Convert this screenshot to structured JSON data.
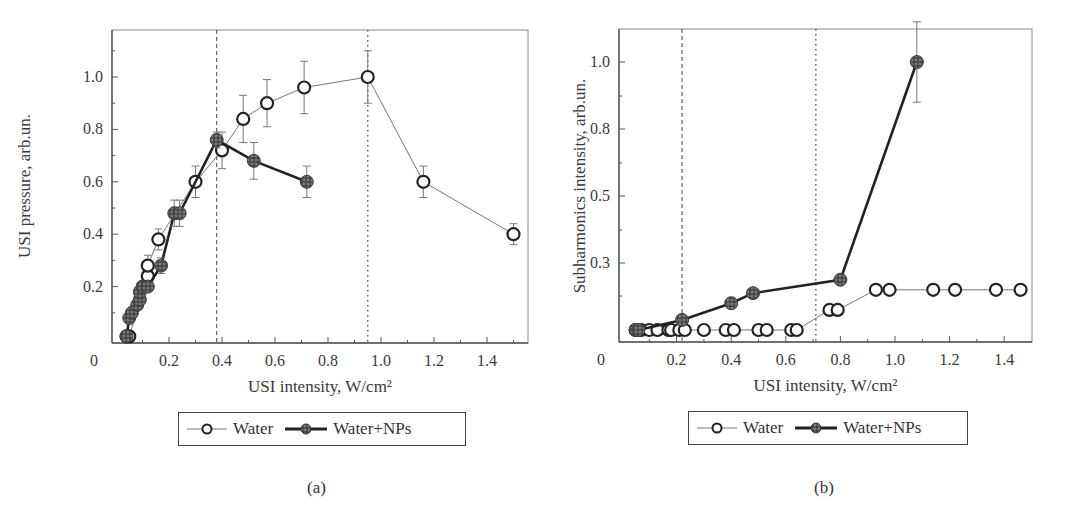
{
  "chart_data": [
    {
      "type": "line",
      "panel_label": "(a)",
      "title": "",
      "xlabel": "USI intensity, W/cm²",
      "ylabel": "USI pressure, arb.un.",
      "xlim": [
        0,
        1.55
      ],
      "ylim": [
        0,
        1.15
      ],
      "x_ticks": [
        "0",
        "0.2",
        "0.4",
        "0.6",
        "0.8",
        "1.0",
        "1.2",
        "1.4"
      ],
      "y_ticks": [
        "0.2",
        "0.4",
        "0.6",
        "0.8",
        "1.0"
      ],
      "grid": false,
      "legend_position": "below",
      "vertical_lines": [
        {
          "x": 0.38,
          "style": "dashed"
        },
        {
          "x": 0.95,
          "style": "dotted"
        }
      ],
      "series": [
        {
          "name": "Water",
          "marker": "open-circle",
          "line": "thin",
          "points": [
            {
              "x": 0.04,
              "y": 0.01
            },
            {
              "x": 0.05,
              "y": 0.01
            },
            {
              "x": 0.12,
              "y": 0.24,
              "err": 0.04
            },
            {
              "x": 0.12,
              "y": 0.28,
              "err": 0.04
            },
            {
              "x": 0.16,
              "y": 0.38,
              "err": 0.04
            },
            {
              "x": 0.3,
              "y": 0.6,
              "err": 0.06
            },
            {
              "x": 0.4,
              "y": 0.72,
              "err": 0.07
            },
            {
              "x": 0.48,
              "y": 0.84,
              "err": 0.09
            },
            {
              "x": 0.57,
              "y": 0.9,
              "err": 0.09
            },
            {
              "x": 0.71,
              "y": 0.96,
              "err": 0.1
            },
            {
              "x": 0.95,
              "y": 1.0,
              "err": 0.1
            },
            {
              "x": 1.16,
              "y": 0.6,
              "err": 0.06
            },
            {
              "x": 1.5,
              "y": 0.4,
              "err": 0.04
            }
          ]
        },
        {
          "name": "Water+NPs",
          "marker": "filled-hatched-circle",
          "line": "thick",
          "points": [
            {
              "x": 0.04,
              "y": 0.01
            },
            {
              "x": 0.05,
              "y": 0.08
            },
            {
              "x": 0.06,
              "y": 0.1
            },
            {
              "x": 0.08,
              "y": 0.13
            },
            {
              "x": 0.09,
              "y": 0.15
            },
            {
              "x": 0.09,
              "y": 0.18
            },
            {
              "x": 0.1,
              "y": 0.2
            },
            {
              "x": 0.12,
              "y": 0.2
            },
            {
              "x": 0.17,
              "y": 0.28,
              "err": 0.03
            },
            {
              "x": 0.22,
              "y": 0.48,
              "err": 0.05
            },
            {
              "x": 0.24,
              "y": 0.48,
              "err": 0.05
            },
            {
              "x": 0.38,
              "y": 0.76,
              "err": 0.03
            },
            {
              "x": 0.52,
              "y": 0.68,
              "err": 0.07
            },
            {
              "x": 0.72,
              "y": 0.6,
              "err": 0.06
            }
          ]
        }
      ]
    },
    {
      "type": "line",
      "panel_label": "(b)",
      "title": "",
      "xlabel": "USI intensity, W/cm²",
      "ylabel": "Subharmonics intensity, arb.un.",
      "xlim": [
        0,
        1.5
      ],
      "ylim": [
        0.08,
        1.12
      ],
      "x_ticks": [
        "0",
        "0.2",
        "0.4",
        "0.6",
        "0.8",
        "1.0",
        "1.2",
        "1.4"
      ],
      "y_ticks": [
        "0.3",
        "0.5",
        "0.8",
        "1.0"
      ],
      "y_axis_note": "labeled ticks are equally spaced (non-linear scale)",
      "grid": false,
      "legend_position": "below",
      "vertical_lines": [
        {
          "x": 0.22,
          "style": "dashed"
        },
        {
          "x": 0.71,
          "style": "dotted"
        }
      ],
      "series": [
        {
          "name": "Water",
          "marker": "open-circle",
          "line": "thin",
          "points": [
            {
              "x": 0.05,
              "y": 0.1
            },
            {
              "x": 0.07,
              "y": 0.1
            },
            {
              "x": 0.1,
              "y": 0.1
            },
            {
              "x": 0.13,
              "y": 0.1
            },
            {
              "x": 0.17,
              "y": 0.1
            },
            {
              "x": 0.18,
              "y": 0.1
            },
            {
              "x": 0.21,
              "y": 0.1
            },
            {
              "x": 0.23,
              "y": 0.1
            },
            {
              "x": 0.3,
              "y": 0.1
            },
            {
              "x": 0.38,
              "y": 0.1
            },
            {
              "x": 0.41,
              "y": 0.1
            },
            {
              "x": 0.5,
              "y": 0.1
            },
            {
              "x": 0.53,
              "y": 0.1
            },
            {
              "x": 0.62,
              "y": 0.1
            },
            {
              "x": 0.64,
              "y": 0.1
            },
            {
              "x": 0.76,
              "y": 0.16
            },
            {
              "x": 0.79,
              "y": 0.16
            },
            {
              "x": 0.93,
              "y": 0.22
            },
            {
              "x": 0.98,
              "y": 0.22
            },
            {
              "x": 1.14,
              "y": 0.22
            },
            {
              "x": 1.22,
              "y": 0.22
            },
            {
              "x": 1.37,
              "y": 0.22
            },
            {
              "x": 1.46,
              "y": 0.22
            }
          ]
        },
        {
          "name": "Water+NPs",
          "marker": "filled-hatched-circle",
          "line": "thick",
          "points": [
            {
              "x": 0.05,
              "y": 0.1
            },
            {
              "x": 0.06,
              "y": 0.1
            },
            {
              "x": 0.22,
              "y": 0.13
            },
            {
              "x": 0.4,
              "y": 0.18
            },
            {
              "x": 0.48,
              "y": 0.21
            },
            {
              "x": 0.8,
              "y": 0.25
            },
            {
              "x": 1.08,
              "y": 1.0,
              "err": 0.12
            }
          ]
        }
      ]
    }
  ],
  "legends": {
    "a": {
      "water": "Water",
      "water_nps": "Water+NPs"
    },
    "b": {
      "water": "Water",
      "water_nps": "Water+NPs"
    }
  },
  "captions": {
    "a": "(a)",
    "b": "(b)"
  },
  "colors": {
    "axis": "#555555",
    "water_line": "#777777",
    "nps_line": "#222222",
    "nps_fill": "#6e6e6e",
    "marker_edge": "#222222"
  }
}
